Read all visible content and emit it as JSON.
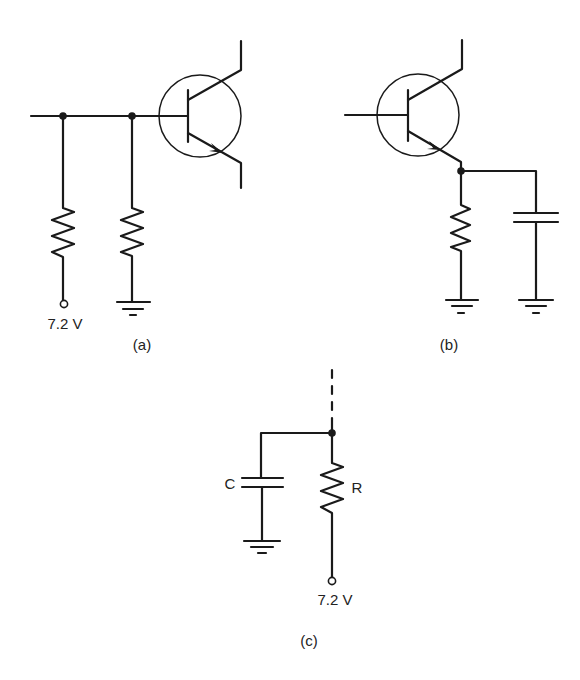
{
  "figure": {
    "panels": [
      {
        "id": "a",
        "caption": "(a)",
        "components": [
          "npn-transistor",
          "resistor-to-supply",
          "resistor-to-ground"
        ],
        "supply_label": "7.2 V"
      },
      {
        "id": "b",
        "caption": "(b)",
        "components": [
          "npn-transistor",
          "emitter-resistor-to-ground",
          "emitter-bypass-capacitor-to-ground"
        ]
      },
      {
        "id": "c",
        "caption": "(c)",
        "components": [
          "capacitor-to-ground",
          "resistor-to-supply"
        ],
        "capacitor_label": "C",
        "resistor_label": "R",
        "supply_label": "7.2 V"
      }
    ]
  },
  "colors": {
    "ink": "#1a1a1a",
    "background": "#ffffff"
  }
}
